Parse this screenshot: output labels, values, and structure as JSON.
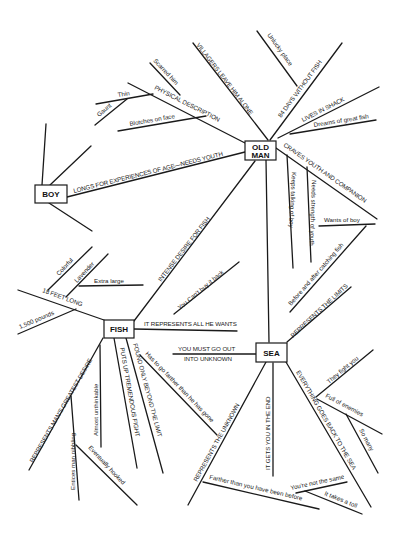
{
  "diagram": {
    "type": "concept-map",
    "nodes": {
      "old_man": {
        "line1": "OLD",
        "line2": "MAN"
      },
      "boy": {
        "label": "BOY"
      },
      "fish": {
        "label": "FISH"
      },
      "sea": {
        "label": "SEA"
      }
    },
    "old_man_branches": {
      "villagers": "VILLAGERS LEAVE HIM ALONE",
      "days": "84 DAYS WITHOUT FISH",
      "unlucky": "Unlucky place",
      "shack": "LIVES IN SHACK",
      "dreams": "Dreams of great fish",
      "physical": "PHYSICAL DESCRIPTION",
      "scarred": "Scarred him",
      "thin": "Thin",
      "gaunt": "Gaunt",
      "blotches": "Blotches on face",
      "craves": "CRAVES YOUTH AND COMPANION",
      "keeps": "Keeps talking of boy",
      "needs": "Needs strength of youth",
      "wants": "Wants of boy",
      "before_after": "Before and after catching fish",
      "longs": "LONGS FOR EXPERIENCES OF AGE—NEEDS YOUTH",
      "intense": "INTENSE DESIRE FOR FISH"
    },
    "fish_branches": {
      "feet": "18 FEET LONG",
      "colorful": "Colorful",
      "lavender": "Lavender",
      "extra_large": "Extra large",
      "pounds": "1,500 pounds",
      "cant_buy": "You Can't buy it back",
      "represents_all": "IT REPRESENTS ALL HE WANTS",
      "greatest_desire": "REPRESENTS MAN'S GREATEST DESIRE",
      "unthinkable": "Almost unthinkable",
      "entices": "Entices man nibbling",
      "hooked": "Eventually hooked",
      "puts_up": "PUTS UP TREMENDOUS FIGHT",
      "found_only": "FOUND ONLY BEYOND THE LIMIT",
      "has_to_go": "Has to go farther than he has gone"
    },
    "sea_branches": {
      "limits": "REPRESENTS THE LIMITS",
      "go_out_1": "YOU MUST GO OUT",
      "go_out_2": "INTO UNKNOWN",
      "unknown": "REPRESENTS THE UNKNOWN",
      "farther": "Farther than you have been before",
      "gets_you": "IT GETS YOU IN THE END",
      "everything": "EVERYTHING GOES BACK TO THE SEA",
      "fight_you": "They fight you",
      "enemies": "Full of enemies",
      "so_many": "So many",
      "not_same": "You're not the same",
      "takes_toll": "It takes a toll"
    }
  }
}
